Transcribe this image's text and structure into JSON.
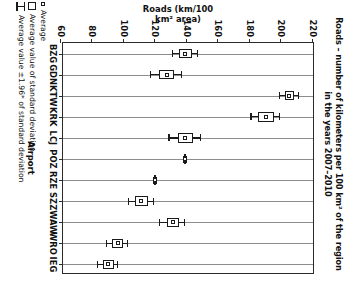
{
  "chart_data": {
    "type": "scatter",
    "title": "Roads – number of kilometers per 100 km² of the region in the years 2007–2010",
    "title_line1": "Roads – number of kilometers per 100 km² of the region",
    "title_line2": "in the years 2007–2010",
    "xlabel": "Airport",
    "ylabel": "Roads (km/100 km² area)",
    "ylim": [
      60,
      220
    ],
    "yticks": [
      220,
      200,
      180,
      160,
      140,
      120,
      100,
      80,
      60
    ],
    "grid": "category-gridlines",
    "legend_position": "right",
    "categories": [
      "BZG",
      "GDN",
      "KTW",
      "KRK",
      "LCJ",
      "POZ",
      "RZE",
      "SZZ",
      "WAW",
      "WRO",
      "IEG"
    ],
    "series": [
      {
        "name": "Average",
        "values": [
          139,
          127,
          205,
          190,
          139,
          139,
          120,
          111,
          131,
          96,
          90
        ]
      },
      {
        "name": "Average value of standard deviation",
        "lower": [
          135,
          122,
          202,
          185,
          134,
          138.4,
          119.4,
          107,
          127,
          92.5,
          86.5
        ],
        "upper": [
          143,
          132,
          208,
          195,
          144,
          139.6,
          120.6,
          115,
          135,
          99.5,
          93.5
        ]
      },
      {
        "name": "Average value ±1.96* of standard deviation",
        "lower": [
          131,
          117,
          199,
          181,
          129,
          138,
          119,
          103,
          123,
          89.5,
          83.5
        ],
        "upper": [
          147,
          137,
          211,
          199,
          149,
          140,
          121,
          119,
          139,
          102.5,
          96.5
        ]
      }
    ],
    "legend": [
      {
        "label": "Average",
        "marker": "small-square"
      },
      {
        "label": "Average value of standard deviation",
        "marker": "box"
      },
      {
        "label": "Average value ±1.96* of standard deviation",
        "marker": "whisker"
      }
    ]
  }
}
